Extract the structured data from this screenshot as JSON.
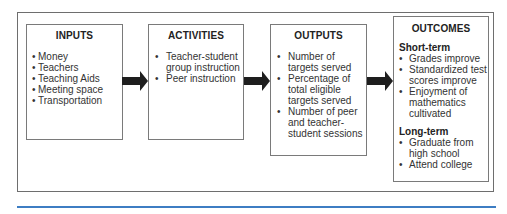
{
  "diagram": {
    "type": "logic-model",
    "boxes": {
      "inputs": {
        "title": "INPUTS",
        "items": [
          "Money",
          "Teachers",
          "Teaching Aids",
          "Meeting space",
          "Transportation"
        ]
      },
      "activities": {
        "title": "ACTIVITIES",
        "items": [
          "Teacher-student group instruction",
          "Peer instruction"
        ]
      },
      "outputs": {
        "title": "OUTPUTS",
        "items": [
          "Number of targets served",
          "Percentage of total eligible targets served",
          "Number of peer and teacher-student sessions"
        ]
      },
      "outcomes": {
        "title": "OUTCOMES",
        "short_term": {
          "label": "Short-term",
          "items": [
            "Grades improve",
            "Standardized test scores improve",
            "Enjoyment of mathematics cultivated"
          ]
        },
        "long_term": {
          "label": "Long-term",
          "items": [
            "Graduate from high school",
            "Attend college"
          ]
        }
      }
    },
    "arrows": [
      {
        "from": "inputs",
        "to": "activities"
      },
      {
        "from": "activities",
        "to": "outputs"
      },
      {
        "from": "outputs",
        "to": "outcomes"
      }
    ],
    "bullet": "•",
    "colors": {
      "arrow": "#1e1e1e",
      "border": "#7a7a7a",
      "rule": "#3d7dc3"
    }
  }
}
